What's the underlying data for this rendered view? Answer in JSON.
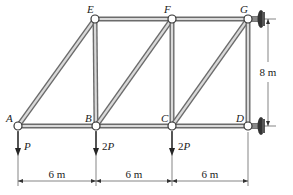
{
  "diagram": {
    "type": "truss",
    "colors": {
      "member_outer": "#6b6b6b",
      "member_inner": "#d9d9d9",
      "pin_fill": "#ffffff",
      "pin_stroke": "#333333",
      "support": "#333333",
      "text": "#222222"
    },
    "nodes": [
      {
        "id": "A",
        "label": "A",
        "x": 18,
        "y": 126
      },
      {
        "id": "B",
        "label": "B",
        "x": 96,
        "y": 126
      },
      {
        "id": "C",
        "label": "C",
        "x": 172,
        "y": 126
      },
      {
        "id": "D",
        "label": "D",
        "x": 248,
        "y": 126
      },
      {
        "id": "E",
        "label": "E",
        "x": 95,
        "y": 19
      },
      {
        "id": "F",
        "label": "F",
        "x": 172,
        "y": 19
      },
      {
        "id": "G",
        "label": "G",
        "x": 248,
        "y": 19
      }
    ],
    "members": [
      [
        "A",
        "B"
      ],
      [
        "B",
        "C"
      ],
      [
        "C",
        "D"
      ],
      [
        "E",
        "F"
      ],
      [
        "F",
        "G"
      ],
      [
        "A",
        "E"
      ],
      [
        "E",
        "B"
      ],
      [
        "B",
        "F"
      ],
      [
        "F",
        "C"
      ],
      [
        "C",
        "G"
      ],
      [
        "G",
        "D"
      ]
    ],
    "supports": [
      {
        "node": "G",
        "type": "pin-wall",
        "side": "right"
      },
      {
        "node": "D",
        "type": "pin-wall",
        "side": "right"
      }
    ],
    "loads": [
      {
        "node": "A",
        "label": "P",
        "direction": "down"
      },
      {
        "node": "B",
        "label": "2P",
        "direction": "down"
      },
      {
        "node": "C",
        "label": "2P",
        "direction": "down"
      }
    ],
    "dimensions": {
      "horizontal": [
        {
          "from": "A",
          "to": "B",
          "label": "6 m"
        },
        {
          "from": "B",
          "to": "C",
          "label": "6 m"
        },
        {
          "from": "C",
          "to": "D",
          "label": "6 m"
        }
      ],
      "vertical": {
        "from": "G",
        "to": "D",
        "label": "8 m"
      }
    }
  }
}
